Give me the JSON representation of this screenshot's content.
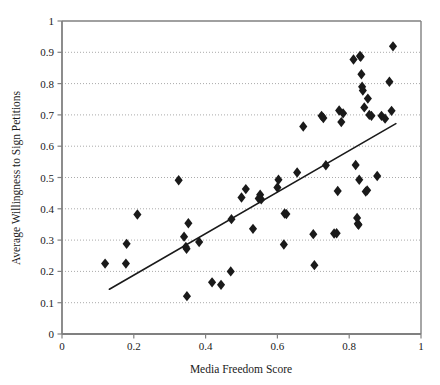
{
  "chart_data": {
    "type": "scatter",
    "title": "",
    "xlabel": "Media Freedom Score",
    "ylabel": "Average Willingness to Sign Petitions",
    "xlim": [
      0,
      1
    ],
    "ylim": [
      0,
      1
    ],
    "xticks": [
      "0",
      "0.2",
      "0.4",
      "0.6",
      "0.8",
      "1"
    ],
    "xtick_values": [
      0,
      0.2,
      0.4,
      0.6,
      0.8,
      1
    ],
    "yticks": [
      "0",
      "0.1",
      "0.2",
      "0.3",
      "0.4",
      "0.5",
      "0.6",
      "0.7",
      "0.8",
      "0.9",
      "1"
    ],
    "ytick_values": [
      0,
      0.1,
      0.2,
      0.3,
      0.4,
      0.5,
      0.6,
      0.7,
      0.8,
      0.9,
      1
    ],
    "grid": {
      "horizontal": true,
      "vertical": false,
      "style": "dotted",
      "color": "#aaaaaa"
    },
    "legend": null,
    "marker": {
      "shape": "diamond",
      "color": "#1a1a1a",
      "size": 5.2
    },
    "points": [
      {
        "x": 0.12,
        "y": 0.225
      },
      {
        "x": 0.178,
        "y": 0.225
      },
      {
        "x": 0.18,
        "y": 0.288
      },
      {
        "x": 0.21,
        "y": 0.382
      },
      {
        "x": 0.325,
        "y": 0.491
      },
      {
        "x": 0.34,
        "y": 0.311
      },
      {
        "x": 0.345,
        "y": 0.278
      },
      {
        "x": 0.347,
        "y": 0.272
      },
      {
        "x": 0.348,
        "y": 0.121
      },
      {
        "x": 0.352,
        "y": 0.354
      },
      {
        "x": 0.382,
        "y": 0.294
      },
      {
        "x": 0.418,
        "y": 0.165
      },
      {
        "x": 0.443,
        "y": 0.157
      },
      {
        "x": 0.47,
        "y": 0.2
      },
      {
        "x": 0.472,
        "y": 0.367
      },
      {
        "x": 0.5,
        "y": 0.436
      },
      {
        "x": 0.512,
        "y": 0.463
      },
      {
        "x": 0.532,
        "y": 0.336
      },
      {
        "x": 0.548,
        "y": 0.433
      },
      {
        "x": 0.552,
        "y": 0.445
      },
      {
        "x": 0.555,
        "y": 0.43
      },
      {
        "x": 0.6,
        "y": 0.468
      },
      {
        "x": 0.603,
        "y": 0.493
      },
      {
        "x": 0.618,
        "y": 0.286
      },
      {
        "x": 0.62,
        "y": 0.385
      },
      {
        "x": 0.625,
        "y": 0.383
      },
      {
        "x": 0.655,
        "y": 0.516
      },
      {
        "x": 0.672,
        "y": 0.663
      },
      {
        "x": 0.7,
        "y": 0.319
      },
      {
        "x": 0.703,
        "y": 0.22
      },
      {
        "x": 0.723,
        "y": 0.697
      },
      {
        "x": 0.728,
        "y": 0.69
      },
      {
        "x": 0.735,
        "y": 0.539
      },
      {
        "x": 0.758,
        "y": 0.321
      },
      {
        "x": 0.765,
        "y": 0.322
      },
      {
        "x": 0.768,
        "y": 0.457
      },
      {
        "x": 0.772,
        "y": 0.714
      },
      {
        "x": 0.778,
        "y": 0.677
      },
      {
        "x": 0.783,
        "y": 0.705
      },
      {
        "x": 0.812,
        "y": 0.877
      },
      {
        "x": 0.818,
        "y": 0.54
      },
      {
        "x": 0.822,
        "y": 0.371
      },
      {
        "x": 0.824,
        "y": 0.352
      },
      {
        "x": 0.826,
        "y": 0.349
      },
      {
        "x": 0.828,
        "y": 0.493
      },
      {
        "x": 0.83,
        "y": 0.888
      },
      {
        "x": 0.832,
        "y": 0.886
      },
      {
        "x": 0.834,
        "y": 0.83
      },
      {
        "x": 0.836,
        "y": 0.79
      },
      {
        "x": 0.838,
        "y": 0.778
      },
      {
        "x": 0.842,
        "y": 0.724
      },
      {
        "x": 0.846,
        "y": 0.455
      },
      {
        "x": 0.85,
        "y": 0.459
      },
      {
        "x": 0.852,
        "y": 0.752
      },
      {
        "x": 0.856,
        "y": 0.7
      },
      {
        "x": 0.862,
        "y": 0.697
      },
      {
        "x": 0.878,
        "y": 0.505
      },
      {
        "x": 0.89,
        "y": 0.697
      },
      {
        "x": 0.9,
        "y": 0.688
      },
      {
        "x": 0.912,
        "y": 0.806
      },
      {
        "x": 0.918,
        "y": 0.713
      },
      {
        "x": 0.922,
        "y": 0.919
      }
    ],
    "trendline": {
      "type": "linear",
      "x_start": 0.132,
      "y_start": 0.143,
      "x_end": 0.93,
      "y_end": 0.672,
      "color": "#1a1a1a",
      "width": 1.6
    }
  }
}
